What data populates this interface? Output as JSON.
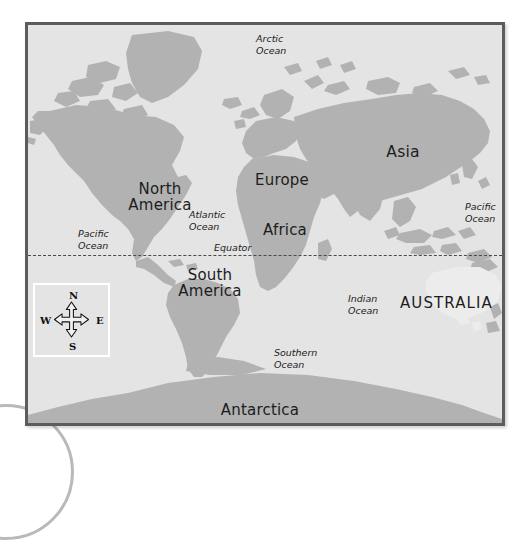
{
  "map": {
    "title": "World Map",
    "continents": [
      {
        "name": "north-america",
        "label": "North\nAmerica"
      },
      {
        "name": "south-america",
        "label": "South\nAmerica"
      },
      {
        "name": "europe",
        "label": "Europe"
      },
      {
        "name": "africa",
        "label": "Africa"
      },
      {
        "name": "asia",
        "label": "Asia"
      },
      {
        "name": "antarctica",
        "label": "Antarctica"
      },
      {
        "name": "australia",
        "label": "AUSTRALIA"
      }
    ],
    "oceans": [
      {
        "name": "arctic-ocean",
        "label": "Arctic\nOcean"
      },
      {
        "name": "pacific-ocean-west",
        "label": "Pacific\nOcean"
      },
      {
        "name": "pacific-ocean-east",
        "label": "Pacific\nOcean"
      },
      {
        "name": "atlantic-ocean",
        "label": "Atlantic\nOcean"
      },
      {
        "name": "indian-ocean",
        "label": "Indian\nOcean"
      },
      {
        "name": "southern-ocean",
        "label": "Southern\nOcean"
      }
    ],
    "equator": {
      "label": "Equator"
    },
    "compass": {
      "north": "N",
      "south": "S",
      "east": "E",
      "west": "W"
    },
    "colors": {
      "ocean_fill": "#e4e4e4",
      "land_fill": "#b2b2b2",
      "highlight_fill": "#ececec",
      "frame_border": "#5c5c5c",
      "label_text": "#1d1d1d",
      "equator_line": "#4a4a4a",
      "compass_box_border": "#ffffff",
      "page_arc": "#b9b9b9"
    }
  }
}
